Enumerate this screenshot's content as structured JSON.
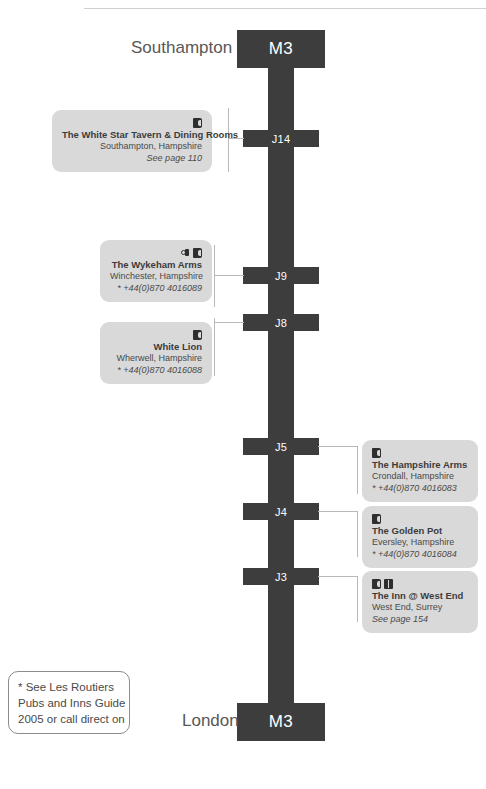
{
  "motorway": {
    "shield_top_label": "M3",
    "shield_bottom_label": "M3",
    "city_top": "Southampton",
    "city_bottom": "London",
    "junctions": [
      {
        "label": "J14"
      },
      {
        "label": "J9"
      },
      {
        "label": "J8"
      },
      {
        "label": "J5"
      },
      {
        "label": "J4"
      },
      {
        "label": "J3"
      }
    ]
  },
  "colors": {
    "road": "#3d3d3d",
    "callout_bg": "#d9d9d9",
    "text": "#3c3c3c",
    "leader_line": "#b9b9b9",
    "note_border": "#8c8c8c"
  },
  "callouts": [
    {
      "name": "The White Star Tavern & Dining Rooms",
      "place": "Southampton, Hampshire",
      "detail": "See page 110",
      "detail_italic": true,
      "icons": [
        "bed-icon"
      ],
      "junction": "J14",
      "side": "left"
    },
    {
      "name": "The Wykeham Arms",
      "place": "Winchester, Hampshire",
      "detail": "* +44(0)870 4016089",
      "detail_italic": true,
      "icons": [
        "fork-icon",
        "bed-icon"
      ],
      "junction": "J9",
      "side": "left"
    },
    {
      "name": "White Lion",
      "place": "Wherwell, Hampshire",
      "detail": "* +44(0)870 4016088",
      "detail_italic": true,
      "icons": [
        "bed-icon"
      ],
      "junction": "J8",
      "side": "left"
    },
    {
      "name": "The Hampshire Arms",
      "place": "Crondall, Hampshire",
      "detail": "* +44(0)870 4016083",
      "detail_italic": true,
      "icons": [
        "bed-icon"
      ],
      "junction": "J5",
      "side": "right"
    },
    {
      "name": "The Golden Pot",
      "place": "Eversley, Hampshire",
      "detail": "* +44(0)870 4016084",
      "detail_italic": true,
      "icons": [
        "bed-icon"
      ],
      "junction": "J4",
      "side": "right"
    },
    {
      "name": "The Inn @ West End",
      "place": "West End, Surrey",
      "detail": "See page 154",
      "detail_italic": true,
      "icons": [
        "bed-icon",
        "book-icon"
      ],
      "junction": "J3",
      "side": "right"
    }
  ],
  "footnote": {
    "line1": "* See Les Routiers",
    "line2": "Pubs and Inns Guide",
    "line3": "2005 or call direct on"
  }
}
